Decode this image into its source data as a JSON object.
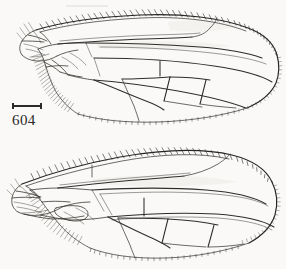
{
  "plate": {
    "title": "Dipteran wing plate",
    "background_color": "#faf9f7",
    "ink_color": "#2e2d2b",
    "figure_count": 2
  },
  "figures": [
    {
      "number": "604",
      "caption_label": "604",
      "subject": "insect-wing-dorsal-view",
      "orientation": "base-left-apex-right",
      "scalebar": {
        "label": "",
        "width_px": 30,
        "caps": 2
      },
      "features": [
        "costal-margin-setae",
        "subcosta",
        "radial-veins-R1-R2+3-R4+5",
        "media-vein",
        "cubital-vein",
        "anal-lobe",
        "alula-fringe",
        "discal-cell",
        "r-m-crossvein",
        "dm-cu-crossvein",
        "marginal-fringe",
        "wing-base-sclerites"
      ]
    },
    {
      "number": "605",
      "caption_label": "605",
      "subject": "insect-wing-dorsal-view",
      "orientation": "base-left-apex-right",
      "scalebar": {
        "label": "",
        "width_px": 52,
        "caps": 2
      },
      "features": [
        "costal-margin-setae",
        "subcosta",
        "radial-veins-R1-R2+3-R4+5",
        "media-vein",
        "cubital-vein",
        "anal-lobe",
        "alula-fringe",
        "discal-cell",
        "r-m-crossvein",
        "dm-cu-crossvein",
        "marginal-fringe",
        "wing-base-sclerites",
        "costal-break"
      ]
    }
  ]
}
